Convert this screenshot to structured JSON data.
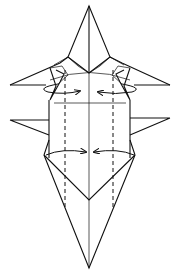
{
  "diagram": {
    "type": "origami-step",
    "colors": {
      "ink": "#111111",
      "paper": "#ffffff"
    },
    "elements": {
      "top_point": {
        "tip": [
          89,
          6
        ]
      },
      "upper_side_flaps": {
        "left_tip": [
          10,
          85
        ],
        "right_tip": [
          170,
          85
        ]
      },
      "lower_side_flaps": {
        "left_tip": [
          10,
          120
        ],
        "right_tip": [
          170,
          118
        ]
      },
      "body": {
        "x": [
          49,
          130
        ],
        "y": [
          103,
          152
        ]
      },
      "bottom_point": {
        "tip": [
          89,
          268
        ],
        "notch": [
          89,
          200
        ]
      },
      "dashed_fold_lines_x": [
        65,
        113
      ],
      "center_line_x": 89
    },
    "arrows": [
      {
        "name": "upper-left-fold-arrow",
        "direction": "right",
        "y": 90
      },
      {
        "name": "upper-right-fold-arrow",
        "direction": "left",
        "y": 90
      },
      {
        "name": "lower-left-fold-arrow",
        "direction": "right",
        "y": 152
      },
      {
        "name": "lower-right-fold-arrow",
        "direction": "left",
        "y": 152
      }
    ]
  }
}
